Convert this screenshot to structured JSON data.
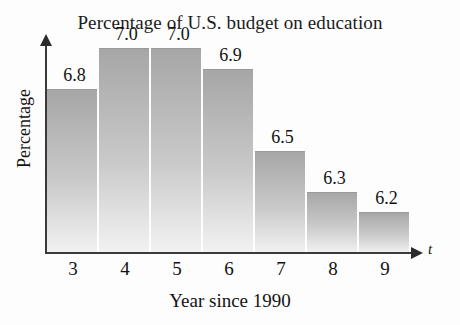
{
  "chart_data": {
    "type": "bar",
    "title": "Percentage of U.S. budget on education",
    "xlabel": "Year since 1990",
    "ylabel": "Percentage",
    "x_axis_variable": "t",
    "categories": [
      "3",
      "4",
      "5",
      "6",
      "7",
      "8",
      "9"
    ],
    "values": [
      6.8,
      7.0,
      7.0,
      6.9,
      6.5,
      6.3,
      6.2
    ],
    "value_labels": [
      "6.8",
      "7.0",
      "7.0",
      "6.9",
      "6.5",
      "6.3",
      "6.2"
    ],
    "grid": false,
    "legend": null,
    "ylim": [
      6.0,
      7.05
    ],
    "y_ticks_shown": false,
    "bar_color": "#b4b4b4",
    "axis_color": "#3a3a3a",
    "background_color": "#fdfdfd",
    "bars": [
      {
        "category": "3",
        "value": 6.8,
        "label": "6.8"
      },
      {
        "category": "4",
        "value": 7.0,
        "label": "7.0"
      },
      {
        "category": "5",
        "value": 7.0,
        "label": "7.0"
      },
      {
        "category": "6",
        "value": 6.9,
        "label": "6.9"
      },
      {
        "category": "7",
        "value": 6.5,
        "label": "6.5"
      },
      {
        "category": "8",
        "value": 6.3,
        "label": "6.3"
      },
      {
        "category": "9",
        "value": 6.2,
        "label": "6.2"
      }
    ]
  }
}
